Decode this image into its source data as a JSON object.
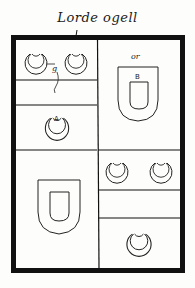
{
  "title": "Lorde ogell",
  "colors": {
    "ink": "#111111",
    "paper": "#fdfdfb"
  },
  "shield": {
    "quarters": [
      {
        "position": "top-left",
        "charges": [
          "crescent",
          "crescent",
          "crescent"
        ],
        "labels": [
          "g",
          "A"
        ],
        "bars": 1
      },
      {
        "position": "top-right",
        "charges": [
          "inescutcheon"
        ],
        "labels": [
          "or",
          "B"
        ]
      },
      {
        "position": "bottom-left",
        "charges": [
          "inescutcheon"
        ],
        "labels": []
      },
      {
        "position": "bottom-right",
        "charges": [
          "crescent",
          "crescent",
          "crescent"
        ],
        "labels": [],
        "bars": 1
      }
    ],
    "tincture_labels": {
      "g": "g",
      "a": "A",
      "or": "or",
      "b": "B"
    }
  }
}
